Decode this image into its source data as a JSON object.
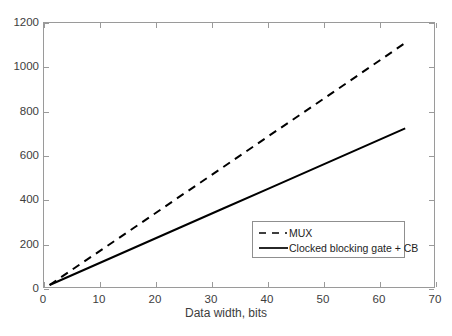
{
  "chart_data": {
    "type": "line",
    "title": "",
    "xlabel": "Data width, bits",
    "ylabel": "",
    "xlim": [
      0,
      70
    ],
    "ylim": [
      0,
      1200
    ],
    "xticks": [
      0,
      10,
      20,
      30,
      40,
      50,
      60,
      70
    ],
    "yticks": [
      0,
      200,
      400,
      600,
      800,
      1000,
      1200
    ],
    "xtick_labels": [
      "0",
      "10",
      "20",
      "30",
      "40",
      "50",
      "60",
      "70"
    ],
    "ytick_labels": [
      "0",
      "200",
      "400",
      "600",
      "800",
      "1000",
      "1200"
    ],
    "grid": false,
    "legend_position": "center-right",
    "series": [
      {
        "name": "MUX",
        "style": "dashed",
        "color": "#000000",
        "x": [
          1,
          8,
          16,
          24,
          32,
          40,
          48,
          56,
          64.5
        ],
        "values": [
          18,
          138,
          275,
          413,
          550,
          688,
          825,
          963,
          1110
        ]
      },
      {
        "name": "Clocked blocking gate + CB",
        "style": "solid",
        "color": "#000000",
        "x": [
          1,
          8,
          16,
          24,
          32,
          40,
          48,
          56,
          64.5
        ],
        "values": [
          18,
          96,
          185,
          274,
          363,
          452,
          541,
          630,
          725
        ]
      }
    ]
  },
  "legend": {
    "items": [
      {
        "label": "MUX",
        "style": "dashed"
      },
      {
        "label": "Clocked blocking gate + CB",
        "style": "solid"
      }
    ]
  },
  "colors": {
    "axis": "#9a9a9a",
    "line": "#000000",
    "text": "#3d3d3d",
    "background": "#ffffff"
  }
}
